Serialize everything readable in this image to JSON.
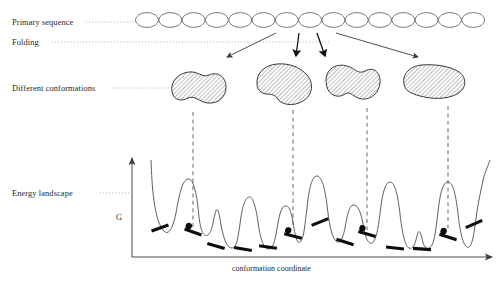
{
  "figure": {
    "type": "protein-folding-energy-landscape-diagram",
    "background_color": "#ffffff",
    "ink_color": "#1a1a1a",
    "labels": {
      "primary_sequence": "Primary sequence",
      "folding": "Folding",
      "different_conformations": "Different conformations",
      "energy_landscape": "Energy landscape",
      "y_axis": "G",
      "x_axis": "conformation coordinate"
    },
    "primary_sequence": {
      "bead_count": 15,
      "bead_rx": 11.5,
      "bead_ry": 7.4,
      "start_x": 147,
      "spacing": 23.3,
      "center_y": 20,
      "stroke": "#555555",
      "fill": "#ffffff"
    },
    "folding_arrows": [
      {
        "x1": 276,
        "y1": 33,
        "x2": 227,
        "y2": 57
      },
      {
        "x1": 299,
        "y1": 33,
        "x2": 296,
        "y2": 56
      },
      {
        "x1": 317,
        "y1": 33,
        "x2": 325,
        "y2": 56
      },
      {
        "x1": 336,
        "y1": 33,
        "x2": 418,
        "y2": 57
      }
    ],
    "conformations": [
      {
        "cx": 196,
        "cy": 88,
        "label": "conformation-blob-1"
      },
      {
        "cx": 286,
        "cy": 84,
        "label": "conformation-blob-2"
      },
      {
        "cx": 351,
        "cy": 85,
        "label": "conformation-blob-3"
      },
      {
        "cx": 434,
        "cy": 82,
        "label": "conformation-blob-4"
      }
    ],
    "dashed_connectors": [
      {
        "x": 193,
        "y1": 112,
        "y2": 230
      },
      {
        "x": 293,
        "y1": 110,
        "y2": 228
      },
      {
        "x": 367,
        "y1": 108,
        "y2": 230
      },
      {
        "x": 448,
        "y1": 106,
        "y2": 232
      }
    ],
    "axes": {
      "origin_x": 132,
      "origin_y": 257,
      "y_top": 158,
      "x_right": 492,
      "stroke": "#4a4a4a"
    },
    "minima_markers": [
      {
        "x": 160,
        "y": 228,
        "angle": -20,
        "has_ball": false
      },
      {
        "x": 193,
        "y": 232,
        "angle": 20,
        "has_ball": true
      },
      {
        "x": 216,
        "y": 246,
        "angle": 16,
        "has_ball": false
      },
      {
        "x": 243,
        "y": 249,
        "angle": 10,
        "has_ball": false
      },
      {
        "x": 268,
        "y": 247,
        "angle": 8,
        "has_ball": false
      },
      {
        "x": 293,
        "y": 236,
        "angle": 14,
        "has_ball": true
      },
      {
        "x": 320,
        "y": 222,
        "angle": -22,
        "has_ball": false
      },
      {
        "x": 345,
        "y": 242,
        "angle": 18,
        "has_ball": false
      },
      {
        "x": 367,
        "y": 234,
        "angle": 16,
        "has_ball": true
      },
      {
        "x": 395,
        "y": 248,
        "angle": 6,
        "has_ball": false
      },
      {
        "x": 422,
        "y": 249,
        "angle": 4,
        "has_ball": false
      },
      {
        "x": 448,
        "y": 237,
        "angle": 18,
        "has_ball": true
      },
      {
        "x": 474,
        "y": 224,
        "angle": -24,
        "has_ball": false
      }
    ]
  },
  "chart_data": {
    "type": "line",
    "title": "",
    "xlabel": "conformation coordinate",
    "ylabel": "G",
    "grid": false,
    "legend": null,
    "xlim": [
      132,
      492
    ],
    "ylim": [
      257,
      158
    ],
    "series": [
      {
        "name": "energy landscape",
        "description": "rugged free-energy profile with multiple local minima and barriers",
        "path": "M 151,160 C 152,188 154,214 161,227 C 167,238 172,232 176,213 C 180,190 183,180 188,179 C 194,178 197,196 199,217 C 201,233 204,237 208,235 C 212,232 213,222 215,214 C 217,205 219,211 221,225 C 224,240 227,248 232,248 C 237,248 238,237 240,224 C 242,207 245,198 249,197 C 253,196 256,208 258,222 C 260,237 263,248 268,249 C 273,250 275,240 277,229 C 279,216 281,207 285,206 C 290,205 292,215 294,228 C 296,240 298,245 301,241 C 304,237 305,224 307,208 C 309,188 312,176 317,176 C 322,176 325,189 327,205 C 329,222 331,236 336,241 C 340,245 343,238 345,228 C 347,216 349,206 353,205 C 358,204 361,213 363,224 C 365,236 368,245 372,243 C 376,241 378,229 380,214 C 382,195 385,182 390,182 C 395,182 398,196 400,214 C 402,232 405,246 409,248 C 413,250 415,244 417,236 C 419,227 421,233 423,243 C 426,250 429,250 432,245 C 435,240 436,227 438,212 C 440,193 443,182 448,182 C 453,182 456,196 458,214 C 460,232 463,245 467,247 C 471,249 473,240 475,226 C 477,208 480,194 484,176 C 487,168 489,163 490,160",
        "stroke": "#4d4d4d",
        "stroke_width": 0.9
      }
    ],
    "annotations": [
      {
        "kind": "minima-ball",
        "count": 4,
        "note": "filled circles mark the four conformations traced by dashed lines"
      },
      {
        "kind": "minima-tick",
        "count": 13,
        "note": "thick black bars mark local energy minima"
      }
    ]
  }
}
